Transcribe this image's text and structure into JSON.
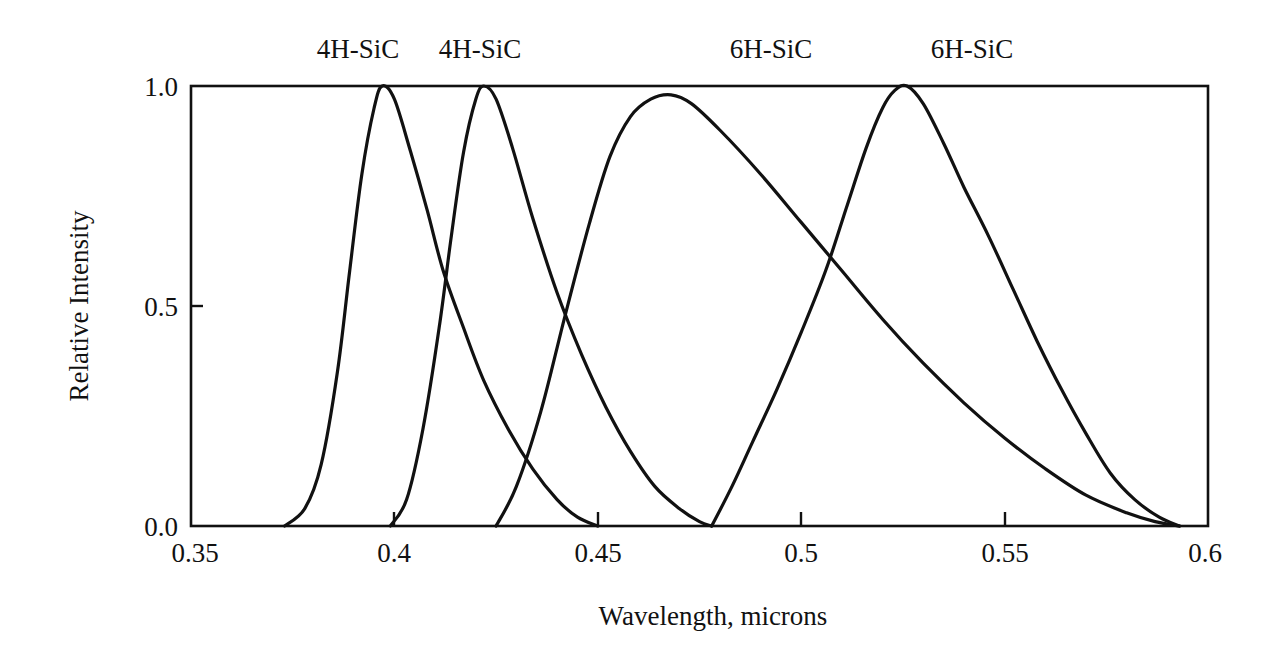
{
  "chart_data": {
    "type": "line",
    "title": "",
    "xlabel": "Wavelength,  microns",
    "ylabel": "Relative Intensity",
    "xlim": [
      0.35,
      0.6
    ],
    "ylim": [
      0.0,
      1.0
    ],
    "x_ticks": [
      0.35,
      0.4,
      0.45,
      0.5,
      0.55,
      0.6
    ],
    "x_tick_labels": [
      "0.35",
      "0.4",
      "0.45",
      "0.5",
      "0.55",
      "0.6"
    ],
    "y_ticks": [
      0.0,
      0.5,
      1.0
    ],
    "y_tick_labels": [
      "0.0",
      "0.5",
      "1.0"
    ],
    "grid": false,
    "legend": "none (series labeled above plot at peak positions)",
    "series": [
      {
        "name": "4H-SiC",
        "label_position_x": 0.397,
        "peak": {
          "x": 0.397,
          "y": 1.0
        },
        "x": [
          0.373,
          0.378,
          0.382,
          0.386,
          0.389,
          0.392,
          0.395,
          0.397,
          0.4,
          0.404,
          0.408,
          0.412,
          0.417,
          0.422,
          0.428,
          0.434,
          0.44,
          0.445,
          0.45
        ],
        "y": [
          0.0,
          0.04,
          0.14,
          0.35,
          0.58,
          0.8,
          0.95,
          1.0,
          0.97,
          0.85,
          0.72,
          0.58,
          0.45,
          0.33,
          0.22,
          0.13,
          0.06,
          0.02,
          0.0
        ]
      },
      {
        "name": "4H-SiC",
        "label_position_x": 0.422,
        "peak": {
          "x": 0.422,
          "y": 1.0
        },
        "x": [
          0.399,
          0.403,
          0.407,
          0.411,
          0.414,
          0.417,
          0.42,
          0.422,
          0.425,
          0.429,
          0.434,
          0.44,
          0.446,
          0.452,
          0.458,
          0.464,
          0.47,
          0.475,
          0.478
        ],
        "y": [
          0.0,
          0.06,
          0.22,
          0.45,
          0.66,
          0.85,
          0.97,
          1.0,
          0.97,
          0.86,
          0.7,
          0.53,
          0.39,
          0.27,
          0.17,
          0.09,
          0.04,
          0.01,
          0.0
        ]
      },
      {
        "name": "6H-SiC",
        "label_position_x": 0.468,
        "peak": {
          "x": 0.468,
          "y": 0.98
        },
        "x": [
          0.425,
          0.43,
          0.436,
          0.442,
          0.448,
          0.453,
          0.458,
          0.463,
          0.468,
          0.473,
          0.48,
          0.49,
          0.5,
          0.51,
          0.52,
          0.53,
          0.54,
          0.55,
          0.56,
          0.57,
          0.58,
          0.587,
          0.593
        ],
        "y": [
          0.0,
          0.09,
          0.26,
          0.48,
          0.69,
          0.84,
          0.93,
          0.97,
          0.98,
          0.96,
          0.9,
          0.8,
          0.69,
          0.58,
          0.47,
          0.37,
          0.28,
          0.2,
          0.13,
          0.07,
          0.03,
          0.01,
          0.0
        ]
      },
      {
        "name": "6H-SiC",
        "label_position_x": 0.526,
        "peak": {
          "x": 0.526,
          "y": 1.0
        },
        "x": [
          0.478,
          0.483,
          0.488,
          0.494,
          0.5,
          0.506,
          0.511,
          0.516,
          0.52,
          0.523,
          0.526,
          0.53,
          0.535,
          0.54,
          0.546,
          0.552,
          0.558,
          0.564,
          0.57,
          0.576,
          0.582,
          0.588,
          0.593
        ],
        "y": [
          0.0,
          0.09,
          0.19,
          0.31,
          0.44,
          0.58,
          0.72,
          0.86,
          0.95,
          0.99,
          1.0,
          0.96,
          0.87,
          0.77,
          0.66,
          0.54,
          0.42,
          0.31,
          0.21,
          0.12,
          0.06,
          0.02,
          0.0
        ]
      }
    ]
  },
  "labels": {
    "series_top": [
      "4H-SiC",
      "4H-SiC",
      "6H-SiC",
      "6H-SiC"
    ],
    "x_axis_title": "Wavelength,  microns",
    "y_axis_title": "Relative Intensity",
    "x_ticks": [
      "0.35",
      "0.4",
      "0.45",
      "0.5",
      "0.55",
      "0.6"
    ],
    "y_ticks": [
      "1.0",
      "0.5",
      "0.0"
    ]
  },
  "colors": {
    "line": "#111111",
    "background": "#ffffff"
  }
}
